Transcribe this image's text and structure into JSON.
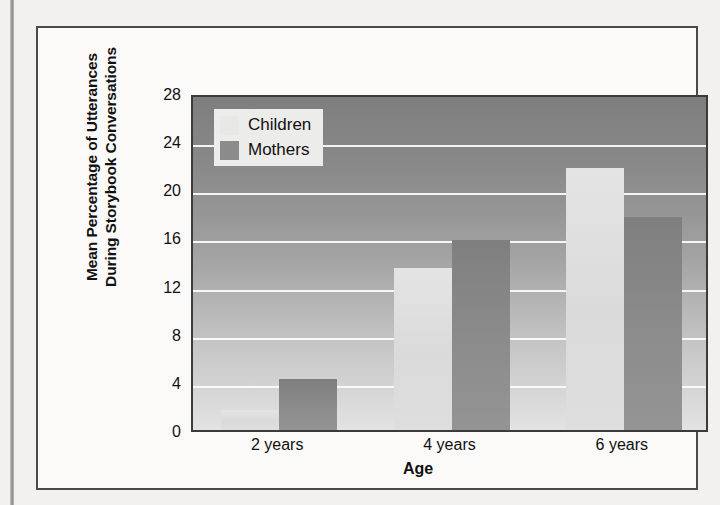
{
  "figure": {
    "y_axis_title_line1": "Mean Percentage of Utterances",
    "y_axis_title_line2": "During Storybook Conversations",
    "x_axis_title": "Age"
  },
  "legend": {
    "items": [
      {
        "label": "Children",
        "swatch": "light-gray-swatch-icon",
        "color": "#e8e8e6"
      },
      {
        "label": "Mothers",
        "swatch": "dark-gray-swatch-icon",
        "color": "#8b8b8b"
      }
    ]
  },
  "chart_data": {
    "type": "bar",
    "title": "",
    "subtitle": "",
    "xlabel": "Age",
    "ylabel": "Mean Percentage of Utterances During Storybook Conversations",
    "categories": [
      "2 years",
      "4 years",
      "6 years"
    ],
    "series": [
      {
        "name": "Children",
        "color": "#dcdcdc",
        "values": [
          1.7,
          13.5,
          21.8
        ]
      },
      {
        "name": "Mothers",
        "color": "#8a8a8a",
        "values": [
          4.2,
          15.8,
          17.7
        ]
      }
    ],
    "ylim": [
      0,
      28
    ],
    "ytick_labels": [
      "0",
      "4",
      "8",
      "12",
      "16",
      "20",
      "24",
      "28"
    ],
    "ytick_values": [
      0,
      4,
      8,
      12,
      16,
      20,
      24,
      28
    ],
    "grid": "horizontal",
    "gridline_color": "#ffffff",
    "legend_position": "top-left-inside",
    "plot_background": "vertical-gradient-dark-to-light"
  }
}
